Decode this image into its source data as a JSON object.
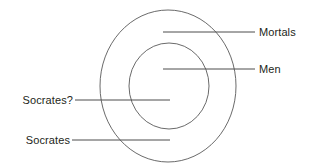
{
  "figure": {
    "type": "venn-diagram",
    "title": "",
    "background_color": "#ffffff",
    "stroke_color": "#595959",
    "text_color": "#231f20"
  },
  "shapes": {
    "outer_circle": {
      "name": "Mortals",
      "cx": 168,
      "cy": 86,
      "rx": 68,
      "ry": 76
    },
    "inner_circle": {
      "name": "Men",
      "cx": 169,
      "cy": 86,
      "rx": 40,
      "ry": 43
    }
  },
  "labels": {
    "mortals": {
      "text": "Mortals",
      "leader_line": {
        "x1": 163,
        "y1": 32,
        "x2": 255,
        "y2": 32
      }
    },
    "men": {
      "text": "Men",
      "leader_line": {
        "x1": 163,
        "y1": 69,
        "x2": 255,
        "y2": 69
      }
    },
    "socrates_question": {
      "text": "Socrates?",
      "leader_line": {
        "x1": 75,
        "y1": 100,
        "x2": 170,
        "y2": 100
      }
    },
    "socrates": {
      "text": "Socrates",
      "leader_line": {
        "x1": 72,
        "y1": 140,
        "x2": 170,
        "y2": 140
      }
    }
  }
}
